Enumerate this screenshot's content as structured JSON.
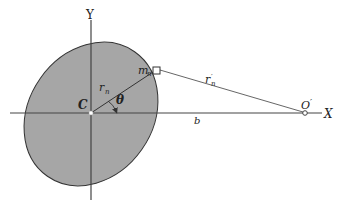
{
  "diagram": {
    "type": "geometry-figure",
    "colors": {
      "body_fill": "#a6a6a6",
      "body_stroke": "#333333",
      "axis": "#444444",
      "line": "#555555",
      "text": "#222222"
    },
    "labels": {
      "y_axis": "Y",
      "x_axis": "X",
      "center": "C",
      "mass": "m",
      "mass_sub": "n",
      "radius": "r",
      "radius_sub": "n",
      "theta": "θ",
      "distance": "b",
      "far_radius": "r",
      "far_radius_prime": "′",
      "far_radius_sub": "n",
      "external_point": "O",
      "external_point_prime": "′"
    },
    "points": {
      "C": [
        91,
        113
      ],
      "m_n": [
        156,
        70
      ],
      "O_prime": [
        305,
        113
      ]
    }
  }
}
